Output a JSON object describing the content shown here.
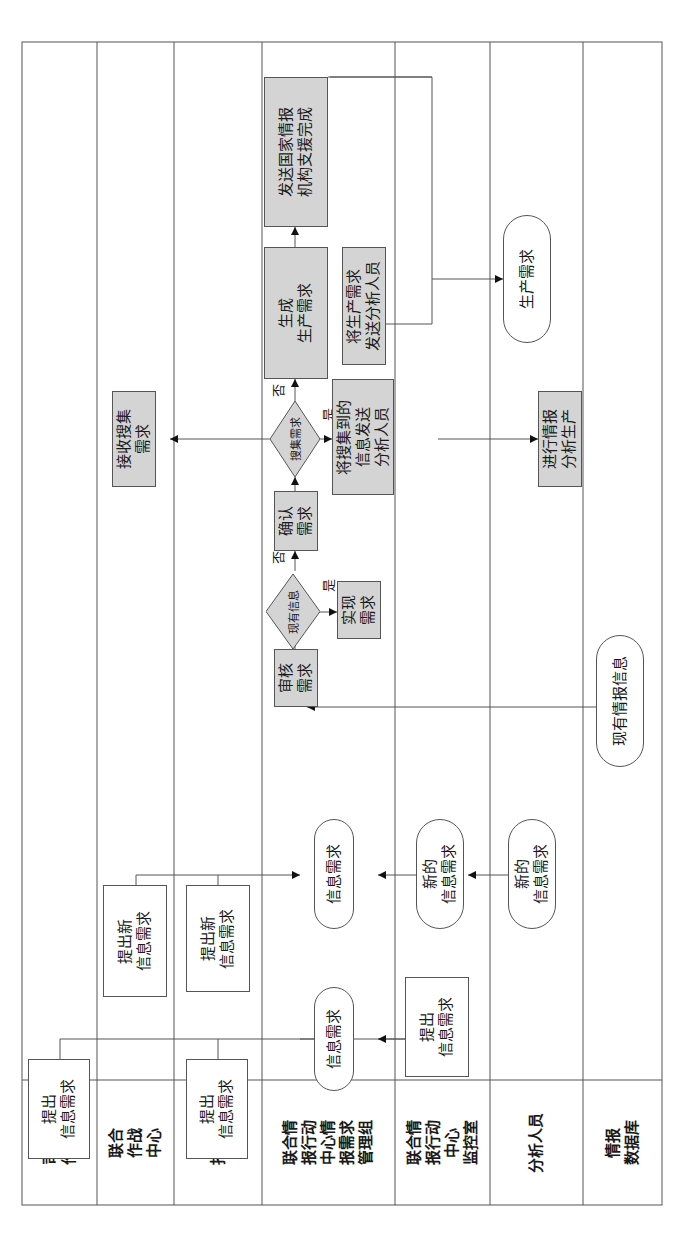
{
  "lanes": [
    {
      "id": "hq-ops",
      "label": "司令部\n作战部"
    },
    {
      "id": "joint-ops-center",
      "label": "联合\n作战\n中心"
    },
    {
      "id": "commander",
      "label": "指挥官"
    },
    {
      "id": "jioc-req-mgmt",
      "label": "联合情\n报行动\n中心情\n报需求\n管理组"
    },
    {
      "id": "jioc-watch",
      "label": "联合情\n报行动\n中心\n监控室"
    },
    {
      "id": "analysts",
      "label": "分析人员"
    },
    {
      "id": "intel-db",
      "label": "情报\n数据库"
    }
  ],
  "nodes": {
    "hq_submit": "提出\n信息需求",
    "commander_submit": "提出\n信息需求",
    "watch_submit": "提出\n信息需求",
    "info_req_1": "信息需求",
    "joc_submit_new": "提出新\n信息需求",
    "commander_submit_new": "提出新\n信息需求",
    "info_req_2": "信息需求",
    "watch_new_req": "新的\n信息需求",
    "analyst_new_req": "新的\n信息需求",
    "existing_intel": "现有情报信息",
    "review_req": "审核\n需求",
    "decision_existing": "现有信息",
    "fulfill_req": "实现\n需求",
    "confirm_req": "确认\n需求",
    "decision_collect": "搜集需求",
    "receive_collect": "接收搜集\n需求",
    "send_collected": "将搜集到的\n信息发送\n分析人员",
    "conduct_analysis": "进行情报\n分析生产",
    "generate_prod": "生成\n生产需求",
    "send_prod_to_analyst": "将生产需求\n发送分析人员",
    "send_national": "发送国家情报\n机构支援完成",
    "prod_req": "生产需求"
  },
  "edge_labels": {
    "existing_yes": "是",
    "existing_no": "否",
    "collect_yes": "是",
    "collect_no": "否"
  },
  "colors": {
    "process_fill": "#d4d4d4",
    "line": "#555555"
  }
}
